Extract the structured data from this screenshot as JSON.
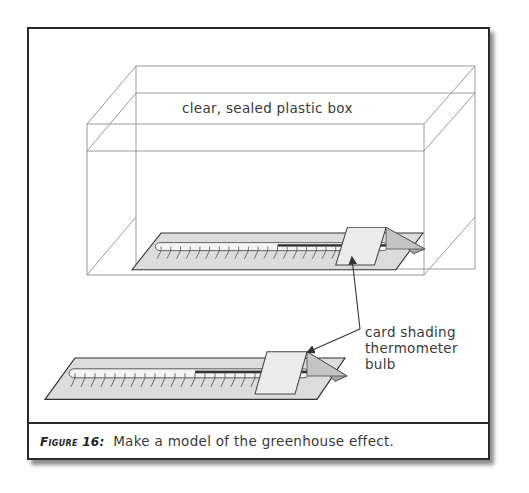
{
  "figure": {
    "caption_prefix": "Figure 16:",
    "caption_text": "Make a model of the greenhouse effect."
  },
  "labels": {
    "box": "clear, sealed plastic box",
    "callout": "card shading thermometer bulb"
  },
  "diagram": {
    "components": [
      {
        "name": "plastic-box",
        "description": "clear, sealed plastic box (wireframe)"
      },
      {
        "name": "thermometer-in-box",
        "description": "thermometer with card shading bulb, inside box"
      },
      {
        "name": "thermometer-outside",
        "description": "thermometer with card shading bulb, outside box"
      }
    ],
    "colors": {
      "frame": "#2a2a2a",
      "box_lines": "#9a9a9a",
      "thermometer_base": "#d9d9d9",
      "card": "#e6e6e6",
      "text": "#3a3a3a"
    }
  }
}
